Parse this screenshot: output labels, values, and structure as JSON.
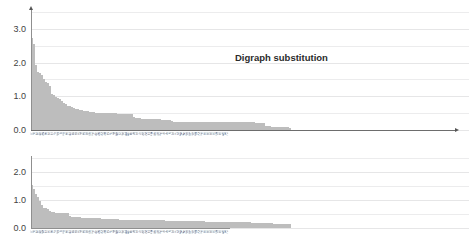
{
  "charts": [
    {
      "id": "digraph",
      "title": "Digraph substitution",
      "ytick_labels": [
        "0.0",
        "1.0",
        "2.0",
        "3.0"
      ]
    },
    {
      "id": "vigenere",
      "title": "Vigenère cipher",
      "ytick_labels": [
        "0.0",
        "1.0",
        "2.0"
      ]
    }
  ],
  "colors": {
    "bar": "#c9c9c9",
    "gridline": "#ececed",
    "axis": "#8f8f8f",
    "arrow": "#555555",
    "title_text": "#2b2b2b",
    "tick_text": "#3f3f3f",
    "background": "#ffffff"
  },
  "chart_data": [
    {
      "type": "bar",
      "title": "Digraph substitution",
      "xlabel": "",
      "ylabel": "",
      "ylim": [
        0,
        3.5
      ],
      "yticks": [
        0.0,
        1.0,
        2.0,
        3.0
      ],
      "ytick_labels": [
        "0.0",
        "1.0",
        "2.0",
        "3.0"
      ],
      "grid": true,
      "legend": "none",
      "categories": [
        "TH",
        "HE",
        "IN",
        "ER",
        "AN",
        "RE",
        "ND",
        "AT",
        "ON",
        "NT",
        "HA",
        "ES",
        "ST",
        "EN",
        "ED",
        "TO",
        "IT",
        "OU",
        "EA",
        "HI",
        "IS",
        "OR",
        "TI",
        "AS",
        "TE",
        "ET",
        "NG",
        "OF",
        "AL",
        "DE",
        "SE",
        "LE",
        "SA",
        "SI",
        "AR",
        "VE",
        "RA",
        "LD",
        "UR",
        "CH",
        "CO",
        "DI",
        "EC",
        "ME",
        "NE",
        "OM",
        "PE",
        "RO",
        "TA",
        "UN",
        "US",
        "EL",
        "FO",
        "IC",
        "LA",
        "LI",
        "MA",
        "NO",
        "PR",
        "SH",
        "SO",
        "SS",
        "TT",
        "WA",
        "WE",
        "AC",
        "AD",
        "AI",
        "BE",
        "CA",
        "CE",
        "CI",
        "CT",
        "DA",
        "DO",
        "EE",
        "EM",
        "EP",
        "EV",
        "EW",
        "FI",
        "GE",
        "GH",
        "GI",
        "GO",
        "HO",
        "ID",
        "IE",
        "IG",
        "IL",
        "IM",
        "IR",
        "IV",
        "KE",
        "LO",
        "LL",
        "LY",
        "MI",
        "MO",
        "NA",
        "NC",
        "NS",
        "OD",
        "OL",
        "OO",
        "OP",
        "OS",
        "OT",
        "OW",
        "PA",
        "PL",
        "PO",
        "RD",
        "RI",
        "RS",
        "RT",
        "RY",
        "SC",
        "SP",
        "SU",
        "TR",
        "TU",
        "TW",
        "UL",
        "UP",
        "UT",
        "VI",
        "WH",
        "WI",
        "YO"
      ],
      "values": [
        2.72,
        2.55,
        1.94,
        1.73,
        1.7,
        1.64,
        1.5,
        1.42,
        1.38,
        1.3,
        1.08,
        1.03,
        0.99,
        0.96,
        0.91,
        0.85,
        0.8,
        0.77,
        0.72,
        0.7,
        0.68,
        0.64,
        0.62,
        0.61,
        0.6,
        0.58,
        0.57,
        0.56,
        0.55,
        0.53,
        0.52,
        0.52,
        0.51,
        0.51,
        0.5,
        0.5,
        0.5,
        0.5,
        0.5,
        0.5,
        0.49,
        0.49,
        0.49,
        0.48,
        0.48,
        0.48,
        0.48,
        0.48,
        0.48,
        0.47,
        0.47,
        0.38,
        0.36,
        0.35,
        0.35,
        0.34,
        0.34,
        0.34,
        0.33,
        0.33,
        0.33,
        0.33,
        0.32,
        0.32,
        0.32,
        0.31,
        0.31,
        0.31,
        0.3,
        0.3,
        0.26,
        0.25,
        0.25,
        0.25,
        0.25,
        0.25,
        0.25,
        0.25,
        0.25,
        0.25,
        0.25,
        0.25,
        0.25,
        0.25,
        0.25,
        0.25,
        0.25,
        0.25,
        0.25,
        0.25,
        0.25,
        0.25,
        0.25,
        0.24,
        0.24,
        0.24,
        0.24,
        0.24,
        0.24,
        0.24,
        0.24,
        0.24,
        0.24,
        0.24,
        0.24,
        0.23,
        0.23,
        0.23,
        0.23,
        0.23,
        0.23,
        0.23,
        0.22,
        0.22,
        0.22,
        0.22,
        0.22,
        0.12,
        0.11,
        0.11,
        0.1,
        0.1,
        0.1,
        0.09,
        0.09,
        0.09,
        0.08,
        0.08,
        0.08,
        0.07
      ]
    },
    {
      "type": "bar",
      "title": "Vigenère cipher",
      "xlabel": "",
      "ylabel": "",
      "ylim": [
        0,
        2.5
      ],
      "yticks": [
        0.0,
        1.0,
        2.0
      ],
      "ytick_labels": [
        "0.0",
        "1.0",
        "2.0"
      ],
      "grid": true,
      "legend": "none",
      "categories": [
        "TH",
        "HE",
        "IN",
        "ER",
        "AN",
        "RE",
        "ND",
        "ON",
        "AT",
        "EN",
        "ES",
        "ST",
        "TO",
        "NT",
        "HA",
        "ED",
        "IT",
        "OU",
        "EA",
        "HI",
        "IS",
        "OR",
        "TI",
        "AS",
        "TE",
        "ET",
        "NG",
        "OF",
        "AL",
        "DE",
        "SE",
        "LE",
        "SA",
        "SI",
        "AR",
        "VE",
        "RA",
        "LD",
        "UR",
        "CH",
        "CO",
        "DI",
        "EC",
        "ME",
        "NE",
        "OM",
        "PE",
        "RO",
        "TA",
        "UN",
        "US",
        "EL",
        "FO",
        "IC",
        "LA",
        "LI",
        "MA",
        "NO",
        "PR",
        "SH",
        "SO",
        "SS",
        "TT",
        "WA",
        "WE",
        "AC",
        "AD",
        "AI",
        "BE",
        "CA",
        "CE",
        "CI",
        "CT",
        "DA",
        "DO",
        "EE",
        "EM",
        "EP",
        "EV",
        "EW",
        "FI",
        "GE",
        "GH",
        "GI",
        "GO",
        "HO",
        "ID",
        "IE",
        "IG",
        "IL",
        "IM",
        "IR",
        "IV",
        "KE",
        "LO",
        "LL",
        "LY",
        "MI",
        "MO",
        "NA",
        "NC",
        "NS",
        "OD",
        "OL",
        "OO",
        "OP",
        "OS",
        "OT",
        "OW",
        "PA",
        "PL",
        "PO",
        "RD",
        "RI",
        "RS",
        "RT",
        "RY",
        "SC",
        "SP",
        "SU",
        "TR",
        "TU",
        "TW",
        "UL",
        "UP",
        "UT",
        "VI",
        "WH",
        "WI",
        "YO"
      ],
      "values": [
        1.55,
        1.4,
        1.22,
        1.1,
        0.95,
        0.82,
        0.72,
        0.7,
        0.68,
        0.6,
        0.58,
        0.56,
        0.55,
        0.55,
        0.54,
        0.54,
        0.53,
        0.53,
        0.52,
        0.42,
        0.41,
        0.4,
        0.39,
        0.38,
        0.38,
        0.37,
        0.37,
        0.36,
        0.36,
        0.35,
        0.35,
        0.35,
        0.34,
        0.34,
        0.34,
        0.33,
        0.33,
        0.33,
        0.32,
        0.32,
        0.32,
        0.31,
        0.31,
        0.31,
        0.3,
        0.3,
        0.3,
        0.3,
        0.3,
        0.3,
        0.3,
        0.29,
        0.29,
        0.29,
        0.29,
        0.28,
        0.28,
        0.28,
        0.28,
        0.28,
        0.28,
        0.28,
        0.27,
        0.27,
        0.27,
        0.27,
        0.27,
        0.26,
        0.26,
        0.26,
        0.26,
        0.26,
        0.26,
        0.25,
        0.25,
        0.25,
        0.25,
        0.25,
        0.25,
        0.25,
        0.24,
        0.24,
        0.24,
        0.24,
        0.24,
        0.24,
        0.24,
        0.23,
        0.23,
        0.23,
        0.23,
        0.23,
        0.23,
        0.22,
        0.22,
        0.22,
        0.22,
        0.22,
        0.22,
        0.21,
        0.21,
        0.21,
        0.21,
        0.21,
        0.21,
        0.2,
        0.2,
        0.2,
        0.2,
        0.2,
        0.19,
        0.19,
        0.19,
        0.19,
        0.18,
        0.18,
        0.18,
        0.18,
        0.17,
        0.17,
        0.17,
        0.16,
        0.16,
        0.16,
        0.15,
        0.15,
        0.15,
        0.14,
        0.14,
        0.13
      ]
    }
  ]
}
